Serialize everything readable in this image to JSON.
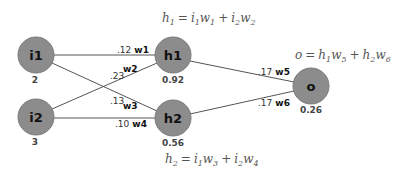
{
  "nodes": {
    "i1": {
      "label": "i1",
      "value": "2"
    },
    "i2": {
      "label": "i2",
      "value": "3"
    },
    "h1": {
      "label": "h1",
      "value": "0.92"
    },
    "h2": {
      "label": "h2",
      "value": "0.56"
    },
    "o": {
      "label": "o",
      "value": "0.26"
    }
  },
  "edges": {
    "w1": {
      "name": "w1",
      "weight": ".12"
    },
    "w2": {
      "name": "w2",
      "weight": ".23"
    },
    "w3": {
      "name": "w3",
      "weight": ".13"
    },
    "w4": {
      "name": "w4",
      "weight": ".10"
    },
    "w5": {
      "name": "w5",
      "weight": ".17"
    },
    "w6": {
      "name": "w6",
      "weight": ".17"
    }
  },
  "equations": {
    "h1": {
      "lhs": "h",
      "lhs_sub": "1",
      "t1a": "i",
      "t1a_sub": "1",
      "t1b": "w",
      "t1b_sub": "1",
      "t2a": "i",
      "t2a_sub": "2",
      "t2b": "w",
      "t2b_sub": "2"
    },
    "h2": {
      "lhs": "h",
      "lhs_sub": "2",
      "t1a": "i",
      "t1a_sub": "1",
      "t1b": "w",
      "t1b_sub": "3",
      "t2a": "i",
      "t2a_sub": "2",
      "t2b": "w",
      "t2b_sub": "4"
    },
    "o": {
      "lhs": "o",
      "lhs_sub": "",
      "t1a": "h",
      "t1a_sub": "1",
      "t1b": "w",
      "t1b_sub": "5",
      "t2a": "h",
      "t2a_sub": "2",
      "t2b": "w",
      "t2b_sub": "6"
    },
    "equals": "=",
    "plus": "+"
  },
  "colors": {
    "node_fill": "#8c8c8c",
    "node_stroke": "#7a7a7a",
    "edge": "#555555"
  }
}
